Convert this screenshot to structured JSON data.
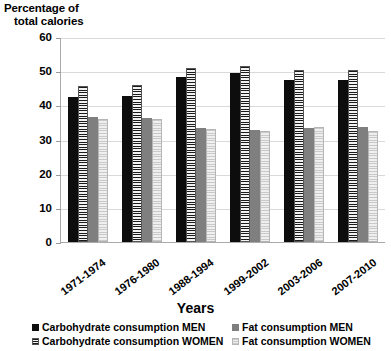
{
  "chart": {
    "y_axis_title_line1": "Percentage of",
    "y_axis_title_line2": "total calories",
    "x_axis_title": "Years"
  },
  "chart_data": {
    "type": "bar",
    "title": "",
    "xlabel": "Years",
    "ylabel": "Percentage of total calories",
    "ylim": [
      0,
      60
    ],
    "yticks": [
      0,
      10,
      20,
      30,
      40,
      50,
      60
    ],
    "grid": true,
    "legend_position": "bottom",
    "categories": [
      "1971-1974",
      "1976-1980",
      "1988-1994",
      "1999-2002",
      "2003-2006",
      "2007-2010"
    ],
    "series": [
      {
        "name": "Carbohydrate consumption  MEN",
        "values": [
          42.4,
          42.6,
          48.4,
          49.4,
          47.3,
          47.5
        ],
        "color": "#0d0d0d"
      },
      {
        "name": "Carbohydrate consumption WOMEN",
        "values": [
          45.6,
          45.9,
          50.9,
          51.4,
          50.4,
          50.4
        ],
        "color": "#1a1a1a"
      },
      {
        "name": "Fat consumption MEN",
        "values": [
          36.6,
          36.2,
          33.4,
          32.8,
          33.3,
          33.6
        ],
        "color": "#7f7f7f"
      },
      {
        "name": "Fat consumption WOMEN",
        "values": [
          36.1,
          36.0,
          33.1,
          32.6,
          33.6,
          32.4
        ],
        "color": "#c9c9c9"
      }
    ]
  },
  "legend": {
    "items": [
      {
        "label": "Carbohydrate consumption  MEN"
      },
      {
        "label": "Fat consumption MEN"
      },
      {
        "label": "Carbohydrate consumption WOMEN"
      },
      {
        "label": "Fat consumption WOMEN"
      }
    ]
  }
}
